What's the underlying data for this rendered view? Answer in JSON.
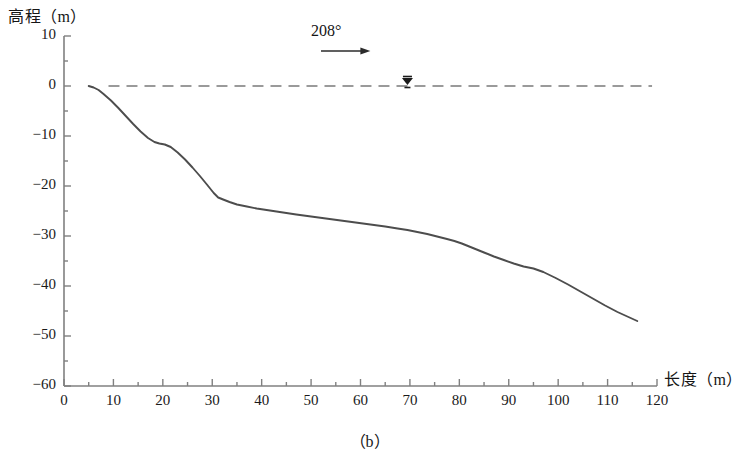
{
  "chart_data": {
    "type": "line",
    "title": "",
    "caption": "（b）",
    "xlabel": "长度（m）",
    "ylabel": "高程（m）",
    "xlim": [
      0,
      120
    ],
    "ylim": [
      -60,
      10
    ],
    "x_ticks": [
      0,
      10,
      20,
      30,
      40,
      50,
      60,
      70,
      80,
      90,
      100,
      110,
      120
    ],
    "x_tick_labels": [
      "0",
      "10",
      "20",
      "30",
      "40",
      "50",
      "60",
      "70",
      "80",
      "90",
      "100",
      "110",
      "120"
    ],
    "x_minor_tick_step": 5,
    "y_ticks": [
      10,
      0,
      -10,
      -20,
      -30,
      -40,
      -50,
      -60
    ],
    "y_tick_labels": [
      "10",
      "0",
      "−10",
      "−20",
      "−30",
      "−40",
      "−50",
      "−60"
    ],
    "y_minor_tick_step": 5,
    "grid": false,
    "legend": null,
    "line_color": "#4d4d4d",
    "axis_color": "#808080",
    "reference_line": {
      "label": "water-surface-line",
      "style": "dashed",
      "y": 0,
      "x_start": 9,
      "x_end": 119,
      "color": "#7a7a7a"
    },
    "annotations": [
      {
        "name": "bearing",
        "text": "208°",
        "x": 51,
        "y": 9,
        "arrow": {
          "x_start": 52,
          "x_end": 62,
          "y": 7,
          "direction": "right"
        }
      },
      {
        "name": "water-level-marker",
        "symbol": "▼",
        "x": 69.5,
        "y": 0
      }
    ],
    "series": [
      {
        "name": "seabed-profile",
        "x": [
          5.0,
          6.0,
          7.0,
          8.0,
          9.5,
          11.0,
          12.5,
          14.0,
          15.5,
          17.0,
          18.3,
          19.3,
          20.4,
          21.6,
          23.0,
          24.5,
          26.0,
          27.5,
          29.0,
          30.3,
          31.2,
          32.2,
          33.5,
          35.0,
          37.0,
          39.0,
          41.0,
          43.0,
          45.0,
          47.0,
          50.0,
          53.0,
          56.0,
          59.0,
          62.0,
          65.0,
          67.5,
          69.5,
          71.5,
          73.5,
          75.5,
          77.5,
          79.0,
          80.5,
          82.0,
          83.5,
          85.0,
          87.0,
          89.0,
          91.0,
          93.0,
          95.0,
          97.0,
          99.5,
          102.0,
          104.5,
          107.0,
          109.5,
          112.0,
          114.0,
          116.0
        ],
        "y": [
          0.0,
          -0.3,
          -0.8,
          -1.6,
          -2.9,
          -4.4,
          -6.0,
          -7.6,
          -9.1,
          -10.4,
          -11.2,
          -11.5,
          -11.7,
          -12.2,
          -13.3,
          -14.7,
          -16.3,
          -18.0,
          -19.8,
          -21.4,
          -22.3,
          -22.7,
          -23.2,
          -23.7,
          -24.1,
          -24.5,
          -24.8,
          -25.1,
          -25.4,
          -25.7,
          -26.1,
          -26.5,
          -26.9,
          -27.3,
          -27.7,
          -28.1,
          -28.5,
          -28.8,
          -29.2,
          -29.6,
          -30.1,
          -30.6,
          -31.0,
          -31.5,
          -32.1,
          -32.7,
          -33.3,
          -34.1,
          -34.8,
          -35.5,
          -36.1,
          -36.5,
          -37.2,
          -38.4,
          -39.7,
          -41.1,
          -42.5,
          -43.9,
          -45.2,
          -46.1,
          -47.0
        ]
      }
    ]
  }
}
